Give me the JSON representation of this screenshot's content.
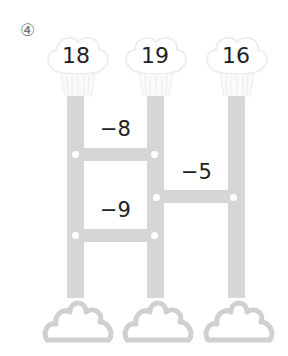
{
  "problem": {
    "number": "④"
  },
  "ladder": {
    "top_values": [
      "18",
      "19",
      "16"
    ],
    "rungs": [
      {
        "between": [
          1,
          2
        ],
        "label": "−8"
      },
      {
        "between": [
          2,
          3
        ],
        "label": "−5"
      },
      {
        "between": [
          1,
          2
        ],
        "label": "−9"
      }
    ],
    "bottom_values": [
      "",
      "",
      ""
    ]
  },
  "colors": {
    "pole": "#d6d6d6",
    "cloud_outline": "#d0d0d0",
    "text": "#222222"
  }
}
